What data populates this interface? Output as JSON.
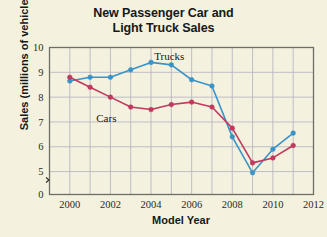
{
  "title": {
    "line1": "New Passenger Car and",
    "line2": "Light Truck Sales"
  },
  "axes": {
    "xlabel": "Model Year",
    "ylabel": "Sales (millions of vehicles)"
  },
  "labels": {
    "trucks": "Trucks",
    "cars": "Cars"
  },
  "colors": {
    "background": "#f4f2de",
    "trucks": "#3a93c8",
    "cars": "#c0395f",
    "grid": "#b9b7c4",
    "axis": "#6e6c63"
  },
  "chart_data": {
    "type": "line",
    "title": "New Passenger Car and Light Truck Sales",
    "xlabel": "Model Year",
    "ylabel": "Sales (millions of vehicles)",
    "x": [
      2000,
      2001,
      2002,
      2003,
      2004,
      2005,
      2006,
      2007,
      2008,
      2009,
      2010,
      2011
    ],
    "xlim": [
      1999,
      2012
    ],
    "ylim": [
      0,
      10
    ],
    "y_ticks": [
      0,
      5,
      6,
      7,
      8,
      9,
      10
    ],
    "x_ticks": [
      2000,
      2002,
      2004,
      2006,
      2008,
      2010,
      2012
    ],
    "y_axis_break": true,
    "grid": true,
    "legend": "inline-annotations",
    "series": [
      {
        "name": "Trucks",
        "color": "#3a93c8",
        "values": [
          8.65,
          8.8,
          8.8,
          9.1,
          9.4,
          9.3,
          8.7,
          8.45,
          6.4,
          4.95,
          5.9,
          6.55
        ]
      },
      {
        "name": "Cars",
        "color": "#c0395f",
        "values": [
          8.8,
          8.4,
          8.0,
          7.6,
          7.5,
          7.7,
          7.8,
          7.6,
          6.75,
          5.35,
          5.55,
          6.05
        ]
      }
    ],
    "annotations": [
      {
        "text": "Trucks",
        "x": 2004.9,
        "y": 9.5
      },
      {
        "text": "Cars",
        "x": 2001.8,
        "y": 7.0
      }
    ]
  }
}
